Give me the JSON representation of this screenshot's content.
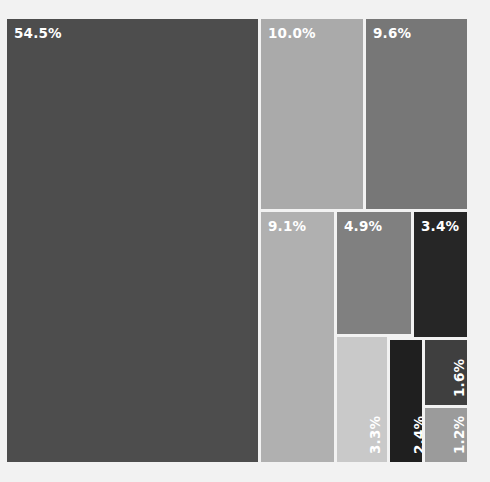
{
  "chart_data": {
    "type": "treemap",
    "title": "",
    "subtitle": "",
    "xlabel": "",
    "ylabel": "",
    "legend": "none",
    "grid": false,
    "value_unit": "percent",
    "total_label": "100%",
    "categories": [
      "54.5%",
      "10.0%",
      "9.6%",
      "9.1%",
      "4.9%",
      "3.4%",
      "3.3%",
      "2.4%",
      "1.6%",
      "1.2%"
    ],
    "values": [
      54.5,
      10.0,
      9.6,
      9.1,
      4.9,
      3.4,
      3.3,
      2.4,
      1.6,
      1.2
    ],
    "tiles": [
      {
        "id": "tile-1",
        "label": "54.5%",
        "value": 54.5,
        "color": "#4d4d4d",
        "text_color": "#ffffff",
        "orientation": "horizontal",
        "rect": {
          "x": 0,
          "y": 0,
          "w": 251,
          "h": 443
        }
      },
      {
        "id": "tile-2",
        "label": "10.0%",
        "value": 10.0,
        "color": "#aaaaaa",
        "text_color": "#ffffff",
        "orientation": "horizontal",
        "rect": {
          "x": 254,
          "y": 0,
          "w": 102,
          "h": 190
        }
      },
      {
        "id": "tile-3",
        "label": "9.6%",
        "value": 9.6,
        "color": "#777777",
        "text_color": "#ffffff",
        "orientation": "horizontal",
        "rect": {
          "x": 359,
          "y": 0,
          "w": 101,
          "h": 190
        }
      },
      {
        "id": "tile-4",
        "label": "9.1%",
        "value": 9.1,
        "color": "#b0b0b0",
        "text_color": "#ffffff",
        "orientation": "horizontal",
        "rect": {
          "x": 254,
          "y": 193,
          "w": 73,
          "h": 250
        }
      },
      {
        "id": "tile-5",
        "label": "4.9%",
        "value": 4.9,
        "color": "#808080",
        "text_color": "#ffffff",
        "orientation": "horizontal",
        "rect": {
          "x": 330,
          "y": 193,
          "w": 74,
          "h": 122
        }
      },
      {
        "id": "tile-6",
        "label": "3.4%",
        "value": 3.4,
        "color": "#262626",
        "text_color": "#ffffff",
        "orientation": "horizontal",
        "rect": {
          "x": 407,
          "y": 193,
          "w": 53,
          "h": 125
        }
      },
      {
        "id": "tile-7",
        "label": "3.3%",
        "value": 3.3,
        "color": "#c9c9c9",
        "text_color": "#ffffff",
        "orientation": "vertical",
        "rect": {
          "x": 330,
          "y": 318,
          "w": 50,
          "h": 125
        }
      },
      {
        "id": "tile-8",
        "label": "2.4%",
        "value": 2.4,
        "color": "#1f1f1f",
        "text_color": "#ffffff",
        "orientation": "vertical",
        "rect": {
          "x": 383,
          "y": 321,
          "w": 32,
          "h": 122
        }
      },
      {
        "id": "tile-9",
        "label": "1.6%",
        "value": 1.6,
        "color": "#3f3f3f",
        "text_color": "#ffffff",
        "orientation": "vertical",
        "rect": {
          "x": 418,
          "y": 321,
          "w": 42,
          "h": 65
        }
      },
      {
        "id": "tile-10",
        "label": "1.2%",
        "value": 1.2,
        "color": "#9b9b9b",
        "text_color": "#ffffff",
        "orientation": "vertical",
        "rect": {
          "x": 418,
          "y": 389,
          "w": 42,
          "h": 54
        }
      }
    ],
    "background_color": "#f2f2f2",
    "tile_gap_color": "#f2f2f2"
  }
}
